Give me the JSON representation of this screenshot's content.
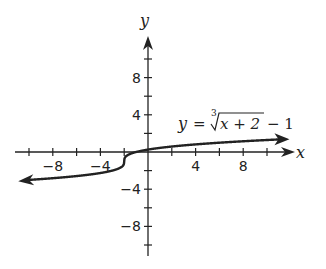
{
  "chart_data": {
    "type": "line",
    "title": "",
    "function": "y = cbrt(x + 2) - 1",
    "annotation": {
      "text_y": "y",
      "text_eq": "=",
      "root_index": "3",
      "radicand": "x + 2",
      "tail": "− 1"
    },
    "xlabel": "x",
    "ylabel": "y",
    "xlim": [
      -10,
      12
    ],
    "ylim": [
      -12,
      12
    ],
    "x_tick_step": 2,
    "y_tick_step": 2,
    "x_tick_labels": [
      "−8",
      "−4",
      "4",
      "8"
    ],
    "x_tick_label_values": [
      -8,
      -4,
      4,
      8
    ],
    "y_tick_labels": [
      "8",
      "4",
      "−4",
      "−8"
    ],
    "y_tick_label_values": [
      8,
      4,
      -4,
      -8
    ],
    "grid": false,
    "series": [
      {
        "name": "y = ∛(x+2) − 1",
        "x": [
          -10.5,
          -8,
          -6,
          -4,
          -3,
          -2,
          -1,
          0,
          2,
          4,
          6,
          8,
          11.5
        ],
        "values": [
          -3.16,
          -2.82,
          -2.59,
          -2.26,
          -2,
          -1,
          0,
          0.26,
          0.59,
          0.82,
          1,
          1.15,
          1.36
        ]
      }
    ]
  }
}
